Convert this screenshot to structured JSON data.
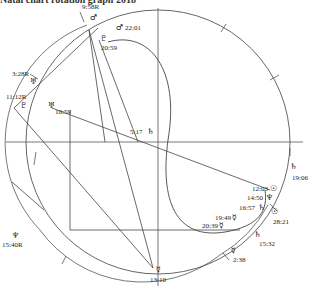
{
  "title": "Natal chart rotation graph 2018",
  "chart": {
    "outer_circle": {
      "cx": 158,
      "cy": 142,
      "r": 132
    },
    "axes": {
      "horizontal_y": 142,
      "vertical_x": 158
    },
    "center_label": {
      "time": "5:17",
      "glyph": "♄"
    },
    "labels": [
      {
        "id": "mars-958R",
        "time": "9:58R",
        "glyph": "♂",
        "x": 82,
        "y": 9,
        "gx": 90,
        "gy": 20
      },
      {
        "id": "mars-2201",
        "time": "22:01",
        "glyph": "♂",
        "x": 125,
        "y": 30,
        "gx": 116,
        "gy": 30
      },
      {
        "id": "pluto-2059",
        "time": "20:59",
        "glyph": "♇",
        "x": 101,
        "y": 50,
        "gx": 100,
        "gy": 41
      },
      {
        "id": "uranus-328R",
        "time": "3:28R",
        "glyph": "♅",
        "x": 12,
        "y": 76,
        "gx": 30,
        "gy": 84
      },
      {
        "id": "pluto-1112R",
        "time": "11:12R",
        "glyph": "♇",
        "x": 6,
        "y": 99,
        "gx": 20,
        "gy": 108
      },
      {
        "id": "uranus-1059",
        "time": "10:59",
        "glyph": "♅",
        "x": 55,
        "y": 114,
        "gx": 48,
        "gy": 108
      },
      {
        "id": "neptune-1540R",
        "time": "15:40R",
        "glyph": "♆",
        "x": 2,
        "y": 247,
        "gx": 12,
        "gy": 238
      },
      {
        "id": "saturn-1906",
        "time": "19:06",
        "glyph": "♄",
        "x": 292,
        "y": 180,
        "gx": 290,
        "gy": 169
      },
      {
        "id": "sun-1203",
        "time": "12:03",
        "glyph": "☉",
        "x": 252,
        "y": 191,
        "gx": 270,
        "gy": 191
      },
      {
        "id": "neptune-1450",
        "time": "14:50",
        "glyph": "♆",
        "x": 247,
        "y": 200,
        "gx": 266,
        "gy": 200
      },
      {
        "id": "saturn-1657",
        "time": "16:57",
        "glyph": "♄",
        "x": 239,
        "y": 210,
        "gx": 258,
        "gy": 210
      },
      {
        "id": "sun-2821",
        "time": "28:21",
        "glyph": "☉",
        "x": 273,
        "y": 224,
        "gx": 271,
        "gy": 214
      },
      {
        "id": "mercury-1949",
        "time": "19:49",
        "glyph": "☿",
        "x": 215,
        "y": 220,
        "gx": 232,
        "gy": 220
      },
      {
        "id": "mercury-2039",
        "time": "20:39",
        "glyph": "☿",
        "x": 202,
        "y": 228,
        "gx": 219,
        "gy": 228
      },
      {
        "id": "saturn-1532",
        "time": "15:32",
        "glyph": "♄",
        "x": 259,
        "y": 246,
        "gx": 254,
        "gy": 237
      },
      {
        "id": "mercury-238",
        "time": "2:38",
        "glyph": "☿",
        "x": 233,
        "y": 262,
        "gx": 231,
        "gy": 253
      },
      {
        "id": "mercury-1310",
        "time": "13:10",
        "glyph": "☿",
        "x": 150,
        "y": 282,
        "gx": 156,
        "gy": 272
      }
    ]
  }
}
